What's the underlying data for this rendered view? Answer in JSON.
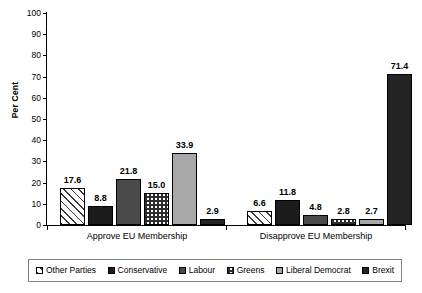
{
  "chart_data": {
    "type": "bar",
    "title": "",
    "xlabel": "",
    "ylabel": "Per Cent",
    "ylim": [
      0,
      100
    ],
    "yticks": [
      0,
      10,
      20,
      30,
      40,
      50,
      60,
      70,
      80,
      90,
      100
    ],
    "grid": false,
    "legend_position": "bottom",
    "categories": [
      "Approve EU Membership",
      "Disapprove EU Membership"
    ],
    "series": [
      {
        "name": "Other Parties",
        "values": [
          17.6,
          6.6
        ],
        "fill": "diagonal-hatch",
        "color": "#ffffff"
      },
      {
        "name": "Conservative",
        "values": [
          8.8,
          11.8
        ],
        "fill": "solid-black",
        "color": "#1c1c1c"
      },
      {
        "name": "Labour",
        "values": [
          21.8,
          4.8
        ],
        "fill": "solid-dark-gray",
        "color": "#4a4a4a"
      },
      {
        "name": "Greens",
        "values": [
          15.0,
          2.8
        ],
        "fill": "checkerboard",
        "color": "#ffffff"
      },
      {
        "name": "Liberal Democrat",
        "values": [
          33.9,
          2.7
        ],
        "fill": "solid-light-gray",
        "color": "#a8a8a8"
      },
      {
        "name": "Brexit",
        "values": [
          2.9,
          71.4
        ],
        "fill": "solid-black",
        "color": "#242424"
      }
    ],
    "data_labels": {
      "Approve EU Membership": [
        "17.6",
        "8.8",
        "21.8",
        "15.0",
        "33.9",
        "2.9"
      ],
      "Disapprove EU Membership": [
        "6.6",
        "11.8",
        "4.8",
        "2.8",
        "2.7",
        "71.4"
      ]
    },
    "ytick_labels": [
      "0",
      "10",
      "20",
      "30",
      "40",
      "50",
      "60",
      "70",
      "80",
      "90",
      "100"
    ]
  },
  "legend": {
    "items": [
      {
        "label": "Other Parties"
      },
      {
        "label": "Conservative"
      },
      {
        "label": "Labour"
      },
      {
        "label": "Greens"
      },
      {
        "label": "Liberal Democrat"
      },
      {
        "label": "Brexit"
      }
    ]
  }
}
